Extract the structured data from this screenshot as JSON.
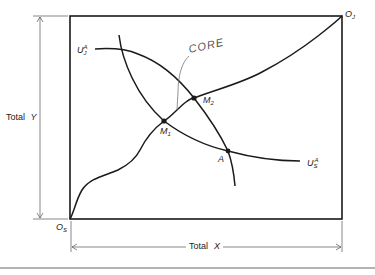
{
  "diagram": {
    "type": "edgeworth-box",
    "colors": {
      "stroke": "#1a1a1a",
      "thin": "#555555",
      "text": "#222222"
    },
    "axes": {
      "vertical_dimension_label": "Total",
      "vertical_dimension_var": "Y",
      "horizontal_dimension_label": "Total",
      "horizontal_dimension_var": "X"
    },
    "origins": {
      "bottom_left": {
        "base": "O",
        "sub": "S"
      },
      "top_right": {
        "base": "O",
        "sub": "J"
      }
    },
    "curves": {
      "indiff_j": {
        "base": "U",
        "sub": "J",
        "sup": "A"
      },
      "indiff_s": {
        "base": "U",
        "sub": "S",
        "sup": "A"
      },
      "core_label": "CORE"
    },
    "points": {
      "m1": {
        "base": "M",
        "sub": "1"
      },
      "m2": {
        "base": "M",
        "sub": "2"
      },
      "a": {
        "base": "A"
      }
    }
  }
}
